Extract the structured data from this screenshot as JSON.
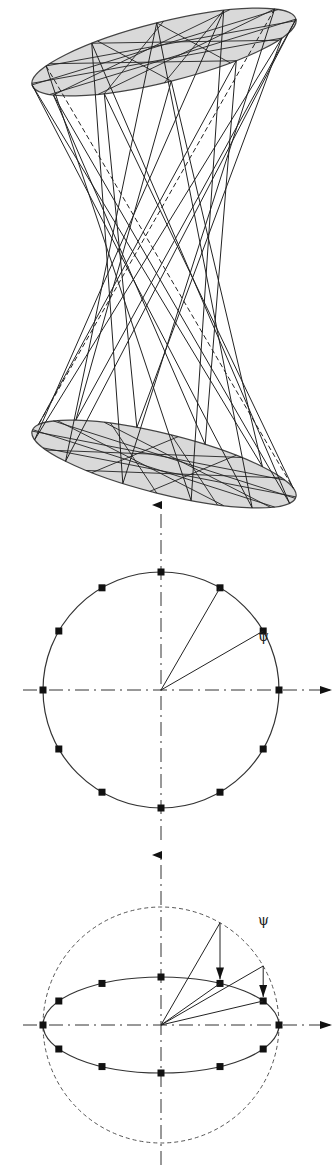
{
  "figure": {
    "hyperboloid": {
      "description": "Hyperboloid of one sheet formed by straight generator lines between two tilted elliptical discs",
      "top_ellipse": {
        "cx": 164,
        "cy": 52,
        "rx": 136,
        "ry": 30,
        "rotate": -14
      },
      "bottom_ellipse": {
        "cx": 164,
        "cy": 464,
        "rx": 136,
        "ry": 30,
        "rotate": 14
      },
      "fill": "#d9d9d9",
      "line_color": "#222222",
      "generator_count": 12
    },
    "circle_diagram": {
      "label": "ψ",
      "center": [
        161,
        690
      ],
      "radius": 118,
      "marker_count": 12
    },
    "ellipse_diagram": {
      "label": "ψ",
      "center": [
        161,
        1025
      ],
      "circle_radius": 118,
      "ellipse_rx": 118,
      "ellipse_ry": 48,
      "marker_count": 12
    }
  }
}
